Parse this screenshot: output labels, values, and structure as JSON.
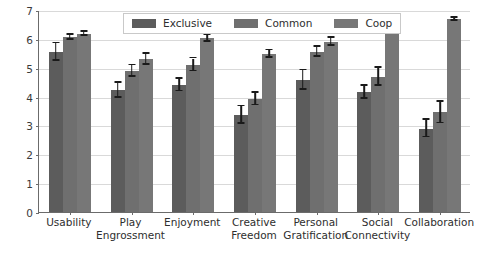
{
  "chart_data": {
    "type": "bar",
    "title": "",
    "xlabel": "",
    "ylabel": "",
    "ylim": [
      0,
      7
    ],
    "yticks": [
      0,
      1,
      2,
      3,
      4,
      5,
      6,
      7
    ],
    "grid": true,
    "legend_position": "upper center",
    "categories": [
      "Usability",
      "Play\nEngrossment",
      "Enjoyment",
      "Creative\nFreedom",
      "Personal\nGratification",
      "Social\nConnectivity",
      "Collaboration"
    ],
    "series": [
      {
        "name": "Exclusive",
        "color": "#5c5c5c",
        "values": [
          5.55,
          4.22,
          4.4,
          3.36,
          4.57,
          4.15,
          2.89
        ],
        "errors": [
          0.3,
          0.26,
          0.22,
          0.3,
          0.34,
          0.22,
          0.3
        ]
      },
      {
        "name": "Common",
        "color": "#6f6f6f",
        "values": [
          6.05,
          4.88,
          5.1,
          3.92,
          5.55,
          4.68,
          3.45
        ],
        "errors": [
          0.09,
          0.2,
          0.22,
          0.22,
          0.18,
          0.31,
          0.37
        ]
      },
      {
        "name": "Coop",
        "color": "#777777",
        "values": [
          6.18,
          5.3,
          6.02,
          5.47,
          5.9,
          6.28,
          6.68
        ],
        "errors": [
          0.07,
          0.19,
          0.12,
          0.13,
          0.14,
          0.12,
          0.05
        ]
      }
    ]
  },
  "legend": {
    "items": [
      {
        "label": "Exclusive",
        "color": "#5c5c5c"
      },
      {
        "label": "Common",
        "color": "#6f6f6f"
      },
      {
        "label": "Coop",
        "color": "#777777"
      }
    ]
  },
  "axis": {
    "y_tick_labels": [
      "0",
      "1",
      "2",
      "3",
      "4",
      "5",
      "6",
      "7"
    ]
  }
}
